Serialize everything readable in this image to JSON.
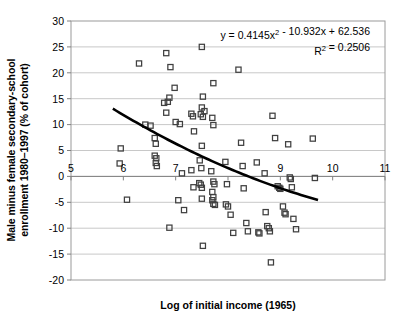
{
  "chart_data": {
    "type": "scatter",
    "title": "",
    "xlabel": "Log of initial income (1965)",
    "ylabel": "Male minus female secondary-school enrollment 1980–1997 (% of cohort)",
    "xlim": [
      5,
      11
    ],
    "ylim": [
      -20,
      30
    ],
    "xticks": [
      5,
      6,
      7,
      8,
      9,
      10,
      11
    ],
    "xtick_labels": [
      "5",
      "6",
      "7",
      "8",
      "9",
      "10",
      "11"
    ],
    "xtick_labels_visible": [
      "5",
      "6",
      "7",
      "",
      "9",
      "10",
      "11"
    ],
    "yticks": [
      -20,
      -15,
      -10,
      -5,
      0,
      5,
      10,
      15,
      20,
      25,
      30
    ],
    "ytick_labels": [
      "-20",
      "-15",
      "-10",
      "-5",
      "0",
      "5",
      "10",
      "15",
      "20",
      "25",
      "30"
    ],
    "grid": "horizontal",
    "legend": "none",
    "marker": "open-square",
    "marker_color": "#404040",
    "annotations": [
      {
        "id": "equation",
        "text": "y = 0.4145x² - 10.932x + 62.536",
        "x": 9.0,
        "y": 27.0
      },
      {
        "id": "r-squared",
        "text": "R² = 0.2506",
        "x": 9.45,
        "y": 24.3
      }
    ],
    "trendline": {
      "type": "quadratic",
      "equation_display": "y = 0.4145x² - 10.932x + 62.536",
      "a": 0.4145,
      "b": -10.932,
      "c": 62.536,
      "r_squared": 0.2506,
      "r_squared_display": "R² = 0.2506",
      "x_start": 5.8,
      "x_end": 9.72,
      "color": "#000000",
      "width": 2.6
    },
    "points": [
      [
        5.93,
        2.5
      ],
      [
        5.95,
        5.4
      ],
      [
        6.07,
        -4.5
      ],
      [
        6.3,
        21.8
      ],
      [
        6.42,
        10.0
      ],
      [
        6.52,
        9.8
      ],
      [
        6.6,
        7.4
      ],
      [
        6.62,
        6.3
      ],
      [
        6.6,
        4.0
      ],
      [
        6.63,
        3.5
      ],
      [
        6.62,
        2.6
      ],
      [
        6.64,
        2.0
      ],
      [
        6.78,
        14.2
      ],
      [
        6.85,
        14.4
      ],
      [
        6.88,
        15.2
      ],
      [
        6.82,
        23.8
      ],
      [
        6.9,
        21.1
      ],
      [
        6.82,
        12.3
      ],
      [
        6.88,
        -9.9
      ],
      [
        6.98,
        17.1
      ],
      [
        7.0,
        10.5
      ],
      [
        7.08,
        10.1
      ],
      [
        7.05,
        -4.6
      ],
      [
        7.12,
        0.6
      ],
      [
        7.16,
        -6.5
      ],
      [
        7.3,
        12.1
      ],
      [
        7.33,
        11.6
      ],
      [
        7.35,
        8.7
      ],
      [
        7.3,
        1.2
      ],
      [
        7.34,
        -2.1
      ],
      [
        7.5,
        25.0
      ],
      [
        7.52,
        15.4
      ],
      [
        7.5,
        13.3
      ],
      [
        7.55,
        12.6
      ],
      [
        7.48,
        12.0
      ],
      [
        7.52,
        11.5
      ],
      [
        7.5,
        5.9
      ],
      [
        7.46,
        3.1
      ],
      [
        7.49,
        1.6
      ],
      [
        7.45,
        -1.3
      ],
      [
        7.48,
        -1.6
      ],
      [
        7.5,
        -2.2
      ],
      [
        7.5,
        -4.3
      ],
      [
        7.52,
        -13.4
      ],
      [
        7.72,
        18.0
      ],
      [
        7.7,
        11.3
      ],
      [
        7.72,
        9.9
      ],
      [
        7.68,
        1.0
      ],
      [
        7.72,
        -1.0
      ],
      [
        7.74,
        -1.5
      ],
      [
        7.7,
        -3.0
      ],
      [
        7.72,
        -4.0
      ],
      [
        7.7,
        -4.6
      ],
      [
        7.72,
        -5.3
      ],
      [
        7.75,
        -5.5
      ],
      [
        7.95,
        2.8
      ],
      [
        7.98,
        -1.5
      ],
      [
        7.96,
        -5.4
      ],
      [
        8.0,
        -5.8
      ],
      [
        8.05,
        -7.4
      ],
      [
        8.1,
        -10.9
      ],
      [
        8.2,
        20.6
      ],
      [
        8.25,
        6.5
      ],
      [
        8.28,
        2.0
      ],
      [
        8.3,
        -2.3
      ],
      [
        8.35,
        -9.0
      ],
      [
        8.38,
        -10.6
      ],
      [
        8.55,
        2.7
      ],
      [
        8.58,
        -10.8
      ],
      [
        8.6,
        -11.0
      ],
      [
        8.7,
        0.6
      ],
      [
        8.72,
        -6.9
      ],
      [
        8.75,
        -9.6
      ],
      [
        8.78,
        -10.0
      ],
      [
        8.8,
        -10.6
      ],
      [
        8.82,
        -16.6
      ],
      [
        8.85,
        11.7
      ],
      [
        8.9,
        7.4
      ],
      [
        8.95,
        -1.9
      ],
      [
        8.98,
        -2.2
      ],
      [
        9.0,
        -2.4
      ],
      [
        9.05,
        -5.8
      ],
      [
        9.08,
        -7.0
      ],
      [
        9.1,
        -7.3
      ],
      [
        9.15,
        6.2
      ],
      [
        9.18,
        -0.2
      ],
      [
        9.2,
        -0.5
      ],
      [
        9.22,
        -2.1
      ],
      [
        9.25,
        -8.2
      ],
      [
        9.3,
        -10.2
      ],
      [
        9.62,
        7.3
      ],
      [
        9.66,
        -0.3
      ]
    ]
  },
  "axis_style": {
    "plot_bg": "#ffffff",
    "border_color": "#808080",
    "grid_color": "#c8c8c8",
    "axis_line_color": "#808080"
  }
}
